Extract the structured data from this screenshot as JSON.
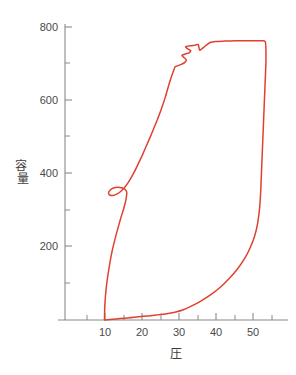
{
  "chart_data": {
    "type": "line",
    "title": "",
    "subtitle": "",
    "xlabel": "圧",
    "ylabel": "容量",
    "xlim": [
      0,
      57
    ],
    "ylim": [
      0,
      810
    ],
    "grid": false,
    "legend": null,
    "legend_position": "none",
    "series_color": "#e0402f",
    "axis_color": "#8a8a8a",
    "x_ticks_major": [
      10,
      20,
      30,
      40,
      50
    ],
    "x_tick_labels": [
      "10",
      "20",
      "30",
      "40",
      "50"
    ],
    "x_ticks_minor": [
      5,
      15,
      25,
      35,
      45,
      55
    ],
    "y_ticks_major": [
      200,
      400,
      600,
      800
    ],
    "y_tick_labels": [
      "200",
      "400",
      "600",
      "800"
    ],
    "y_ticks_minor": [
      100,
      300,
      500,
      700
    ],
    "annotations": [],
    "series": [
      {
        "name": "圧-容量ループ",
        "closed_loop": true,
        "description": "pressure-volume hysteresis loop with inflection notch near 350 mL and saw-tooth ripple near 700-760 mL",
        "points": [
          [
            9.8,
            0
          ],
          [
            9.9,
            40
          ],
          [
            10.3,
            90
          ],
          [
            11.0,
            140
          ],
          [
            11.9,
            190
          ],
          [
            13.0,
            235
          ],
          [
            14.1,
            275
          ],
          [
            15.0,
            305
          ],
          [
            15.6,
            330
          ],
          [
            15.8,
            347
          ],
          [
            15.5,
            355
          ],
          [
            14.6,
            360
          ],
          [
            13.4,
            362
          ],
          [
            12.2,
            360
          ],
          [
            11.3,
            354
          ],
          [
            10.9,
            347
          ],
          [
            11.2,
            341
          ],
          [
            12.1,
            340
          ],
          [
            13.2,
            344
          ],
          [
            14.3,
            352
          ],
          [
            15.3,
            363
          ],
          [
            16.3,
            377
          ],
          [
            17.4,
            396
          ],
          [
            18.6,
            420
          ],
          [
            19.9,
            448
          ],
          [
            21.2,
            478
          ],
          [
            22.5,
            509
          ],
          [
            23.8,
            541
          ],
          [
            25.0,
            573
          ],
          [
            26.1,
            606
          ],
          [
            27.0,
            638
          ],
          [
            27.8,
            664
          ],
          [
            28.4,
            681
          ],
          [
            28.8,
            691
          ],
          [
            29.6,
            694
          ],
          [
            30.6,
            698
          ],
          [
            31.4,
            703
          ],
          [
            31.8,
            710
          ],
          [
            31.2,
            716
          ],
          [
            30.6,
            722
          ],
          [
            31.6,
            726
          ],
          [
            32.6,
            729
          ],
          [
            33.0,
            735
          ],
          [
            32.2,
            740
          ],
          [
            31.6,
            745
          ],
          [
            32.8,
            748
          ],
          [
            34.2,
            750
          ],
          [
            35.0,
            752
          ],
          [
            35.2,
            744
          ],
          [
            35.4,
            736
          ],
          [
            36.2,
            742
          ],
          [
            37.2,
            750
          ],
          [
            38.2,
            757
          ],
          [
            39.6,
            760
          ],
          [
            42.0,
            761
          ],
          [
            45.0,
            762
          ],
          [
            48.0,
            762
          ],
          [
            50.5,
            762
          ],
          [
            52.2,
            762
          ],
          [
            53.0,
            760
          ],
          [
            53.2,
            740
          ],
          [
            53.2,
            700
          ],
          [
            53.0,
            650
          ],
          [
            52.8,
            600
          ],
          [
            52.6,
            550
          ],
          [
            52.4,
            500
          ],
          [
            52.2,
            450
          ],
          [
            52.0,
            400
          ],
          [
            51.8,
            350
          ],
          [
            51.5,
            305
          ],
          [
            51.0,
            265
          ],
          [
            50.2,
            230
          ],
          [
            49.0,
            198
          ],
          [
            47.5,
            168
          ],
          [
            45.6,
            140
          ],
          [
            43.4,
            114
          ],
          [
            41.0,
            90
          ],
          [
            38.4,
            69
          ],
          [
            35.6,
            51
          ],
          [
            33.0,
            37
          ],
          [
            31.0,
            28
          ],
          [
            29.0,
            22
          ],
          [
            26.5,
            17
          ],
          [
            24.0,
            14
          ],
          [
            21.5,
            11
          ],
          [
            19.0,
            9
          ],
          [
            16.5,
            6
          ],
          [
            14.0,
            4
          ],
          [
            12.0,
            2
          ],
          [
            10.6,
            1
          ],
          [
            9.8,
            0
          ]
        ]
      }
    ]
  },
  "geometry": {
    "x_axis_pixel_y": 320,
    "y_axis_pixel_x": 65,
    "x_pixel_at_0": 68,
    "x_pixels_per_unit": 3.72,
    "y_pixel_at_0": 320,
    "y_pixels_per_unit": 0.3665
  }
}
